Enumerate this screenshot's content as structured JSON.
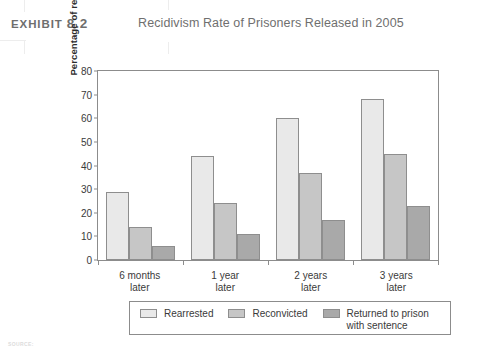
{
  "header": {
    "exhibit_label": "Exhibit",
    "exhibit_number": "8.2",
    "title": "Recidivism Rate of Prisoners Released in 2005"
  },
  "footer": {
    "source_prefix": "SOURCE:"
  },
  "legend": {
    "items": [
      {
        "label": "Rearrested",
        "color": "#e9e9e9"
      },
      {
        "label": "Reconvicted",
        "color": "#c6c6c6"
      },
      {
        "label": "Returned to prison\nwith sentence",
        "color": "#a9a9a9"
      }
    ]
  },
  "chart_data": {
    "type": "bar",
    "title": "Recidivism Rate of Prisoners Released in 2005",
    "xlabel": "",
    "ylabel": "Percentage of released prisoners",
    "categories": [
      "6 months\nlater",
      "1 year\nlater",
      "2 years\nlater",
      "3 years\nlater"
    ],
    "series": [
      {
        "name": "Rearrested",
        "color": "#e9e9e9",
        "values": [
          29,
          44,
          60,
          68
        ]
      },
      {
        "name": "Reconvicted",
        "color": "#c6c6c6",
        "values": [
          14,
          24,
          37,
          45
        ]
      },
      {
        "name": "Returned to prison with sentence",
        "color": "#a9a9a9",
        "values": [
          6,
          11,
          17,
          23
        ]
      }
    ],
    "ylim": [
      0,
      80
    ],
    "yticks": [
      0,
      10,
      20,
      30,
      40,
      50,
      60,
      70,
      80
    ],
    "ytick_labels": [
      "0",
      "10",
      "20",
      "30",
      "40",
      "50",
      "60",
      "70",
      "80"
    ],
    "grid": false,
    "legend_position": "bottom"
  }
}
